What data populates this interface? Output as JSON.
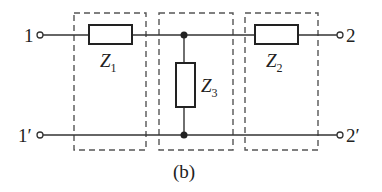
{
  "diagram": {
    "caption": "(b)",
    "colors": {
      "line": "#333333",
      "dashed": "#555555",
      "background": "#ffffff"
    },
    "terminals": {
      "top_left": "1",
      "bottom_left": "1′",
      "top_right": "2",
      "bottom_right": "2′"
    },
    "impedances": [
      {
        "id": "Z1",
        "label": "Z",
        "subscript": "1",
        "orientation": "series",
        "position": "top-left"
      },
      {
        "id": "Z3",
        "label": "Z",
        "subscript": "3",
        "orientation": "shunt",
        "position": "middle"
      },
      {
        "id": "Z2",
        "label": "Z",
        "subscript": "2",
        "orientation": "series",
        "position": "top-right"
      }
    ],
    "dashed_boxes": 3,
    "junction_nodes": 2
  }
}
